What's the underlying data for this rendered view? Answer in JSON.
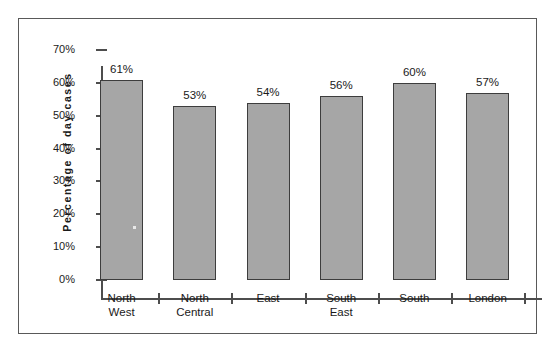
{
  "chart_data": {
    "type": "bar",
    "title": "",
    "subtitle": "",
    "xlabel": "",
    "ylabel": "Percentage  of  day  cases",
    "categories": [
      "North West",
      "North Central",
      "East",
      "South East",
      "South",
      "London"
    ],
    "category_lines": [
      [
        "North",
        "West"
      ],
      [
        "North",
        "Central"
      ],
      [
        "East",
        ""
      ],
      [
        "South",
        "East"
      ],
      [
        "South",
        ""
      ],
      [
        "London",
        ""
      ]
    ],
    "values": [
      61,
      53,
      54,
      56,
      60,
      57
    ],
    "data_labels": [
      "61%",
      "53%",
      "54%",
      "56%",
      "60%",
      "57%"
    ],
    "ylim": [
      0,
      70
    ],
    "y_ticks": [
      0,
      10,
      20,
      30,
      40,
      50,
      60,
      70
    ],
    "y_tick_labels": [
      "0%",
      "10%",
      "20%",
      "30%",
      "40%",
      "50%",
      "60%",
      "70%"
    ],
    "grid": false,
    "legend": null,
    "bar_fill_color": "#a6a6a6",
    "bar_border_color": "#3d3d3d",
    "axis_color": "#4d4d4d",
    "text_color": "#1a1a1a",
    "background_color": "#ffffff",
    "frame_border_color": "#595959"
  }
}
